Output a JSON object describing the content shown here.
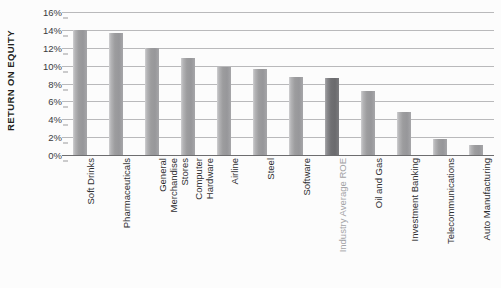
{
  "chart_data": {
    "type": "bar",
    "title": "",
    "xlabel": "",
    "ylabel": "RETURN ON EQUITY",
    "ylim": [
      0,
      16
    ],
    "ytick_labels": [
      "16%",
      "14%",
      "12%",
      "10%",
      "8%",
      "6%",
      "4%",
      "2%",
      "0%"
    ],
    "ytick_values": [
      16,
      14,
      12,
      10,
      8,
      6,
      4,
      2,
      0
    ],
    "grid": true,
    "legend": false,
    "value_suffix": "%",
    "categories": [
      "Soft Drinks",
      "Pharmaceuticals",
      "General\nMerchandise\nStores",
      "Computer\nHardware",
      "Airline",
      "Steel",
      "Software",
      "Industry Average ROE",
      "Oil and Gas",
      "Investment Banking",
      "Telecommunications",
      "Auto Manufacturing"
    ],
    "values": [
      14.0,
      13.6,
      12.0,
      10.9,
      9.9,
      9.6,
      8.7,
      8.6,
      7.2,
      4.8,
      1.8,
      1.1
    ],
    "highlight_index": 7,
    "colors": {
      "bar": "#9a9a9c",
      "bar_highlight": "#6e6e70",
      "gridline": "#b9b9bb",
      "baseline": "#6d6d6f",
      "tick_label": "#3a3a3c",
      "category_label": "#2f2f31",
      "category_label_muted": "#a3a3a6",
      "axis_title": "#231f20",
      "background": "#fcfcfc"
    }
  }
}
